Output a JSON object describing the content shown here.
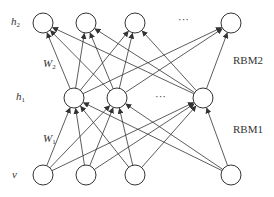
{
  "diagram": {
    "type": "stacked RBM / deep belief network",
    "layers": {
      "h2": {
        "label": "h",
        "sub": "2",
        "nodes_x": [
          43,
          86,
          135,
          231
        ],
        "y": 23,
        "ellipsis": "···"
      },
      "h1": {
        "label": "h",
        "sub": "1",
        "nodes_x": [
          74,
          117,
          203
        ],
        "y": 98,
        "ellipsis": "···"
      },
      "v": {
        "label": "v",
        "nodes_x": [
          43,
          86,
          135,
          231
        ],
        "y": 175
      }
    },
    "weights": {
      "w2": {
        "label": "W",
        "sub": "2"
      },
      "w1": {
        "label": "W",
        "sub": "1"
      }
    },
    "blocks": {
      "rbm2": "RBM2",
      "rbm1": "RBM1"
    },
    "node_radius": 10,
    "colors": {
      "stroke": "#333333",
      "fill": "#ffffff"
    }
  }
}
